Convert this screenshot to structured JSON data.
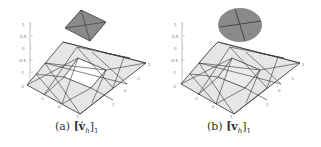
{
  "figure": {
    "panels": [
      {
        "id": "a",
        "caption_label": "(a)",
        "caption_math": "[v̇h]1",
        "caption_main": "[v̇",
        "caption_sub": "h",
        "caption_close": "]",
        "caption_index": "1",
        "z_ticks": [
          "1",
          "0.5",
          "0",
          "-0.5",
          "-1",
          "-2"
        ],
        "x_ticks": [
          "-1",
          "0",
          "1"
        ],
        "y_ticks": [
          "2",
          "1",
          "0",
          "-1"
        ],
        "top_patch_shape": "square",
        "top_patch_color": "#8a8a8a",
        "mesh_fill": "#e4e4e4",
        "mesh_edge": "#333333"
      },
      {
        "id": "b",
        "caption_label": "(b)",
        "caption_math": "[vh]1",
        "caption_main": "[v",
        "caption_sub": "h",
        "caption_close": "]",
        "caption_index": "1",
        "z_ticks": [
          "1",
          "0.5",
          "0",
          "-0.5",
          "-1",
          "-2"
        ],
        "x_ticks": [
          "-1",
          "0",
          "1"
        ],
        "y_ticks": [
          "2",
          "1",
          "0",
          "-1"
        ],
        "top_patch_shape": "disk",
        "top_patch_color": "#8a8a8a",
        "mesh_fill": "#e4e4e4",
        "mesh_edge": "#333333"
      }
    ]
  }
}
